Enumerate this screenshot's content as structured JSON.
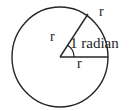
{
  "figure": {
    "name": "circle-one-radian-diagram",
    "background_color": "#ffffff",
    "stroke_color": "#262626",
    "text_color": "#262626",
    "labels": {
      "radius_arc_end": "r",
      "radius_slanted": "r",
      "radius_horizontal": "r",
      "angle": "1 radian"
    },
    "geometry": {
      "circle_center_x": 60,
      "circle_center_y": 57,
      "circle_radius_x": 48,
      "circle_radius_y": 50,
      "angle_arc_radius": 14,
      "horizontal_radius_end_x": 108,
      "horizontal_radius_end_y": 57,
      "slanted_radius_end_x": 88,
      "slanted_radius_end_y": 14
    }
  }
}
